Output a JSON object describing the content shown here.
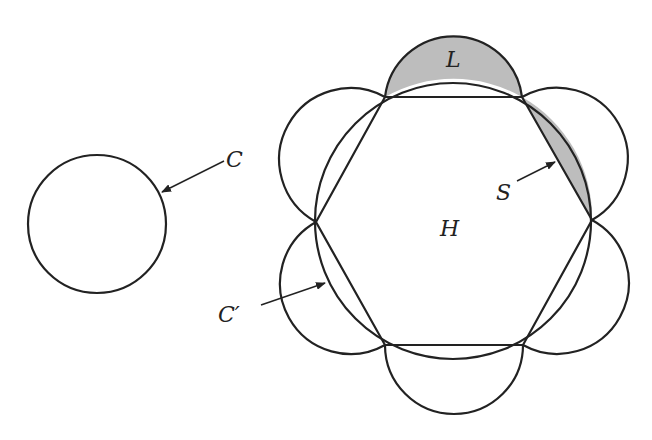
{
  "diagram": {
    "title": "",
    "labels": {
      "circle_c": "C",
      "circle_c_prime": "C′",
      "hexagon": "H",
      "lune": "L",
      "segment": "S"
    },
    "colors": {
      "stroke": "#222222",
      "shaded": "#bdbdbd",
      "background": "#ffffff"
    },
    "elements": [
      {
        "id": "C",
        "type": "circle",
        "description": "isolated circle on the left"
      },
      {
        "id": "C'",
        "type": "circle",
        "description": "circumscribed circle of regular hexagon H"
      },
      {
        "id": "H",
        "type": "regular-hexagon",
        "description": "inscribed in C'"
      },
      {
        "id": "semicircles",
        "type": "semicircle",
        "count": 6,
        "description": "semicircles erected outward on each hexagon side"
      },
      {
        "id": "L",
        "type": "lune",
        "shaded": true,
        "description": "region between top semicircle and C'"
      },
      {
        "id": "S",
        "type": "circular-segment",
        "shaded": true,
        "description": "region between hexagon side and C'"
      }
    ]
  }
}
